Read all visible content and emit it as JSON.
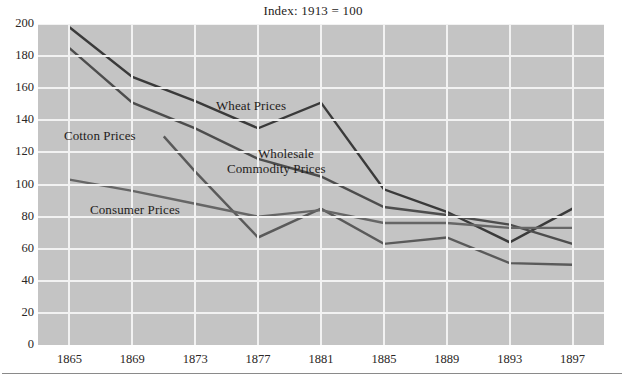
{
  "chart_data": {
    "type": "line",
    "title": "Index: 1913 = 100",
    "xlabel": "",
    "ylabel": "",
    "xlim": [
      1863,
      1899
    ],
    "ylim": [
      0,
      200
    ],
    "grid": true,
    "legend_position": "inline-annotations",
    "x": [
      1865,
      1869,
      1873,
      1877,
      1881,
      1885,
      1889,
      1893,
      1897
    ],
    "xtick_labels": [
      "1865",
      "1869",
      "1873",
      "1877",
      "1881",
      "1885",
      "1889",
      "1893",
      "1897"
    ],
    "ytick_labels": [
      "200",
      "180",
      "160",
      "140",
      "120",
      "100",
      "80",
      "60",
      "40",
      "20",
      "0"
    ],
    "ytick_values": [
      200,
      180,
      160,
      140,
      120,
      100,
      80,
      60,
      40,
      20,
      0
    ],
    "series": [
      {
        "name": "Wheat Prices",
        "color": "#3a3a3a",
        "x": [
          1865,
          1869,
          1873,
          1877,
          1881,
          1885,
          1889,
          1893,
          1897
        ],
        "values": [
          198,
          167,
          152,
          135,
          151,
          97,
          83,
          64,
          85
        ]
      },
      {
        "name": "Wholesale Commodity Prices",
        "color": "#4d4d4d",
        "x": [
          1865,
          1869,
          1873,
          1877,
          1881,
          1885,
          1889,
          1893,
          1897
        ],
        "values": [
          185,
          151,
          135,
          116,
          105,
          86,
          81,
          75,
          63
        ]
      },
      {
        "name": "Cotton Prices",
        "color": "#5a5a5a",
        "x": [
          1871,
          1873,
          1877,
          1881,
          1885,
          1889,
          1893,
          1897
        ],
        "values": [
          130,
          108,
          67,
          85,
          63,
          67,
          51,
          50
        ]
      },
      {
        "name": "Consumer Prices",
        "color": "#666666",
        "x": [
          1865,
          1869,
          1873,
          1877,
          1881,
          1885,
          1889,
          1893,
          1897
        ],
        "values": [
          103,
          96,
          88,
          80,
          84,
          76,
          76,
          73,
          73
        ]
      }
    ],
    "annotations": [
      {
        "text": "Wheat Prices",
        "x_px": 216,
        "y_px": 98
      },
      {
        "text": "Cotton Prices",
        "x_px": 64,
        "y_px": 128
      },
      {
        "text": "Wholesale",
        "x_px": 258,
        "y_px": 146
      },
      {
        "text": "Commodity Prices",
        "x_px": 227,
        "y_px": 161
      },
      {
        "text": "Consumer Prices",
        "x_px": 90,
        "y_px": 202
      }
    ],
    "style": {
      "plot_background": "#c4c4c4",
      "gridline_color": "#f2f2f2",
      "text_color": "#231f20"
    }
  }
}
